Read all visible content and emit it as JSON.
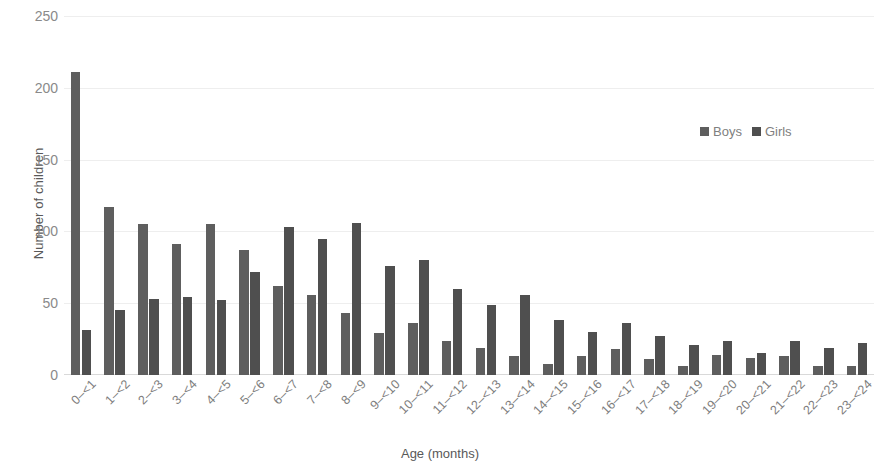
{
  "chart_data": {
    "type": "bar",
    "title": "",
    "xlabel": "Age (months)",
    "ylabel": "Number of children",
    "ylim": [
      0,
      250
    ],
    "yticks": [
      0,
      50,
      100,
      150,
      200,
      250
    ],
    "grid": true,
    "legend_position": "top-right",
    "categories": [
      "0–<1",
      "1–<2",
      "2–<3",
      "3–<4",
      "4–<5",
      "5–<6",
      "6–<7",
      "7–<8",
      "8–<9",
      "9–<10",
      "10–<11",
      "11–<12",
      "12–<13",
      "13–<14",
      "14–<15",
      "15–<16",
      "16–<17",
      "17–<18",
      "18–<19",
      "19–<20",
      "20–<21",
      "21–<22",
      "22–<23",
      "23–<24"
    ],
    "series": [
      {
        "name": "Boys",
        "color": "#5e5e5e",
        "values": [
          211,
          117,
          105,
          91,
          105,
          87,
          62,
          56,
          43,
          29,
          36,
          24,
          19,
          13,
          8,
          13,
          18,
          11,
          6,
          14,
          12,
          13,
          6,
          6
        ]
      },
      {
        "name": "Girls",
        "color": "#4f4f4f",
        "values": [
          31,
          45,
          53,
          54,
          52,
          72,
          103,
          95,
          106,
          76,
          80,
          60,
          49,
          56,
          38,
          30,
          36,
          27,
          21,
          24,
          15,
          24,
          19,
          22
        ]
      }
    ]
  },
  "legend": {
    "entries": [
      {
        "label": "Boys"
      },
      {
        "label": "Girls"
      }
    ]
  }
}
